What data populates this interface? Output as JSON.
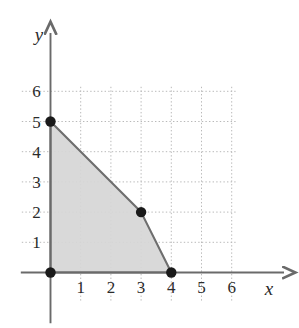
{
  "figure": {
    "title": "",
    "x_axis_label": "x",
    "y_axis_label": "y"
  },
  "chart_data": {
    "type": "line",
    "title": "",
    "xlabel": "x",
    "ylabel": "y",
    "xlim": [
      -0.95,
      7.1
    ],
    "ylim": [
      -0.95,
      7.1
    ],
    "grid": true,
    "grid_style": "dotted",
    "grid_color": "#b9b9b9",
    "legend": "none",
    "x_ticks": [
      1,
      2,
      3,
      4,
      5,
      6
    ],
    "y_ticks": [
      1,
      2,
      3,
      4,
      5,
      6
    ],
    "x_tick_labels": [
      "1",
      "2",
      "3",
      "4",
      "5",
      "6"
    ],
    "y_tick_labels": [
      "1",
      "2",
      "3",
      "4",
      "5",
      "6"
    ],
    "series": [
      {
        "name": "feasible-region",
        "type": "area",
        "fill_color": "#d6d6d6",
        "edge_color": "#6e6e6e",
        "points": [
          {
            "x": 0,
            "y": 0
          },
          {
            "x": 0,
            "y": 5
          },
          {
            "x": 3,
            "y": 2
          },
          {
            "x": 4,
            "y": 0
          }
        ]
      },
      {
        "name": "vertices",
        "type": "scatter",
        "marker": "filled-circle",
        "color": "#1a1a1a",
        "points": [
          {
            "x": 0,
            "y": 0,
            "label": "(0, 0)"
          },
          {
            "x": 0,
            "y": 5,
            "label": "(0, 5)"
          },
          {
            "x": 3,
            "y": 2,
            "label": "(3, 2)"
          },
          {
            "x": 4,
            "y": 0,
            "label": "(4, 0)"
          }
        ]
      }
    ],
    "axis_color": "#6a6a6a",
    "axis_arrows": [
      "x-positive",
      "y-positive"
    ]
  }
}
